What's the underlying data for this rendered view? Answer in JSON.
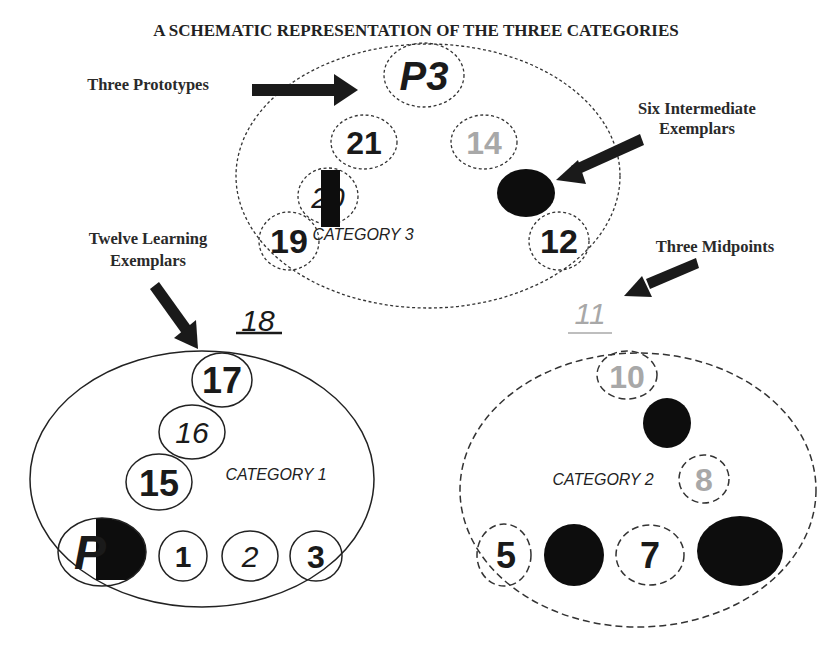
{
  "title": "A SCHEMATIC REPRESENTATION OF THE THREE CATEGORIES",
  "annotations": {
    "prototypes": "Three Prototypes",
    "intermediate_line1": "Six Intermediate",
    "intermediate_line2": "Exemplars",
    "learning_line1": "Twelve Learning",
    "learning_line2": "Exemplars",
    "midpoints": "Three Midpoints"
  },
  "categories": {
    "cat1": {
      "label": "CATEGORY 1",
      "items": {
        "prototype": "P",
        "e1": "1",
        "e2": "2",
        "e3": "3",
        "e15": "15",
        "e16": "16",
        "e17": "17"
      },
      "midpoint": "18"
    },
    "cat2": {
      "label": "CATEGORY 2",
      "items": {
        "e5": "5",
        "e7": "7",
        "e8": "8",
        "e10": "10"
      },
      "midpoint": "11"
    },
    "cat3": {
      "label": "CATEGORY 3",
      "items": {
        "prototype": "P3",
        "e12": "12",
        "e14": "14",
        "e19": "19",
        "e20": "20",
        "e21": "21"
      }
    }
  },
  "colors": {
    "ink": "#1a1a1a",
    "gray": "#a8a8a8",
    "background": "#ffffff"
  }
}
